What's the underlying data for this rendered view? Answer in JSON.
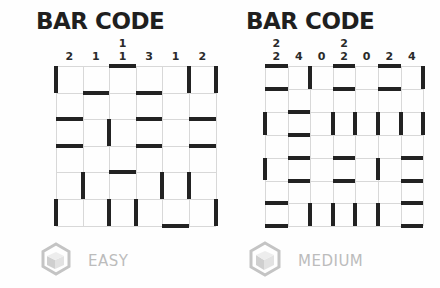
{
  "puzzles": [
    {
      "title": "BAR CODE",
      "difficulty": "EASY",
      "icon": "cube-icon",
      "cols": 6,
      "rows": 6,
      "col_hints": [
        [
          "2"
        ],
        [
          "1"
        ],
        [
          "1",
          "1"
        ],
        [
          "3"
        ],
        [
          "1"
        ],
        [
          "2"
        ]
      ],
      "row_hints": [
        "1, 2",
        "0",
        "1",
        "0",
        "1, 2",
        "1, 2, 1"
      ],
      "horizontal_segments": [
        [
          2
        ],
        [
          1,
          3
        ],
        [
          0,
          3,
          5
        ],
        [
          0,
          3,
          5
        ],
        [
          2
        ],
        [],
        [
          4
        ]
      ],
      "vertical_segments": [
        [
          0,
          5,
          6
        ],
        [],
        [
          2
        ],
        [],
        [
          1,
          4,
          5
        ],
        [
          0,
          2,
          3,
          6
        ]
      ]
    },
    {
      "title": "BAR CODE",
      "difficulty": "MEDIUM",
      "icon": "cube-icon",
      "cols": 7,
      "rows": 7,
      "col_hints": [
        [
          "2",
          "2"
        ],
        [
          "4"
        ],
        [
          "0"
        ],
        [
          "2",
          "2"
        ],
        [
          "0"
        ],
        [
          "2"
        ],
        [
          "4"
        ]
      ],
      "row_hints": [
        "1, 1",
        "0",
        "1, 5",
        "0",
        "1, 1",
        "0",
        "4"
      ],
      "horizontal_segments": [
        [
          0,
          3,
          5
        ],
        [
          0,
          3,
          5
        ],
        [
          1
        ],
        [
          1
        ],
        [
          1,
          3,
          6
        ],
        [
          1,
          3,
          6
        ],
        [
          0,
          6
        ],
        [
          0,
          6
        ]
      ],
      "vertical_segments": [
        [
          2,
          7
        ],
        [],
        [
          0,
          3,
          4,
          5,
          6,
          7
        ],
        [],
        [
          0,
          5
        ],
        [],
        [
          2,
          3,
          4,
          5
        ]
      ]
    }
  ],
  "colors": {
    "segment": "#222222",
    "gridline": "#d8d8d8",
    "title": "#1f1f1f",
    "difficulty_label": "#bcbcbc"
  }
}
